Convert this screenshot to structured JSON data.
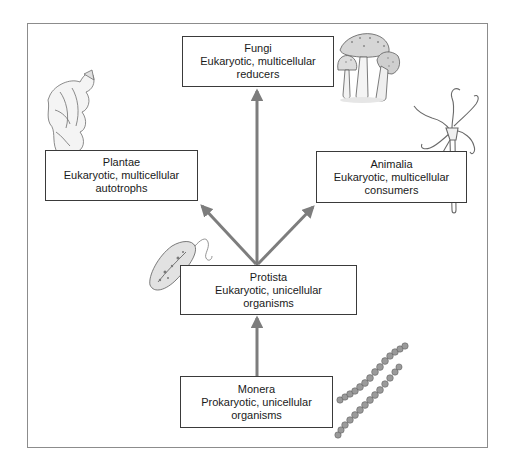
{
  "diagram": {
    "arrow_color": "#7d7d7d",
    "box_border_color": "#3a3a3a",
    "nodes": [
      {
        "id": "fungi",
        "name": "Fungi",
        "line1": "Eukaryotic, multicellular",
        "line2": "reducers",
        "illustration": "mushroom-cluster"
      },
      {
        "id": "plantae",
        "name": "Plantae",
        "line1": "Eukaryotic, multicellular",
        "line2": "autotrophs",
        "illustration": "seaweed-frond"
      },
      {
        "id": "animalia",
        "name": "Animalia",
        "line1": "Eukaryotic, multicellular",
        "line2": "consumers",
        "illustration": "hydra"
      },
      {
        "id": "protista",
        "name": "Protista",
        "line1": "Eukaryotic, unicellular",
        "line2": "organisms",
        "illustration": "euglena"
      },
      {
        "id": "monera",
        "name": "Monera",
        "line1": "Prokaryotic, unicellular",
        "line2": "organisms",
        "illustration": "bacteria-chains"
      }
    ],
    "edges": [
      {
        "from": "monera",
        "to": "protista"
      },
      {
        "from": "protista",
        "to": "fungi"
      },
      {
        "from": "protista",
        "to": "plantae"
      },
      {
        "from": "protista",
        "to": "animalia"
      }
    ]
  }
}
